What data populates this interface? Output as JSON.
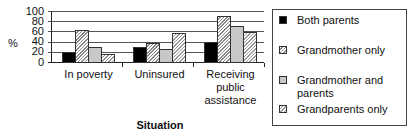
{
  "chart_data": {
    "type": "bar",
    "title": "",
    "xlabel": "Situation",
    "ylabel": "%",
    "ylim": [
      0,
      100
    ],
    "yticks": [
      "100",
      "80",
      "60",
      "40",
      "20",
      "0"
    ],
    "grid": true,
    "legend_position": "right",
    "categories": [
      "In poverty",
      "Uninsured",
      "Receiving public assistance"
    ],
    "category_lines": [
      [
        "In poverty"
      ],
      [
        "Uninsured"
      ],
      [
        "Receiving",
        "public",
        "assistance"
      ]
    ],
    "series": [
      {
        "name": "Both parents",
        "values": [
          20,
          30,
          40
        ],
        "fill": "#000000"
      },
      {
        "name": "Grandmother only",
        "values": [
          62,
          38,
          90
        ],
        "fill": "hatched"
      },
      {
        "name": "Grandmother and parents",
        "values": [
          30,
          26,
          70
        ],
        "fill": "#c8c8c8"
      },
      {
        "name": "Grandparents only",
        "values": [
          16,
          56,
          58
        ],
        "fill": "hatched-light"
      }
    ]
  },
  "legend": {
    "items": [
      {
        "label": "Both parents"
      },
      {
        "label": "Grandmother only"
      },
      {
        "label": "Grandmother and parents"
      },
      {
        "label": "Grandparents only"
      }
    ]
  }
}
